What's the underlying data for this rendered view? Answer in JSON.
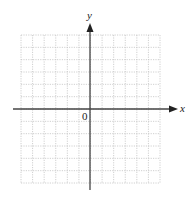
{
  "diagram": {
    "type": "coordinate-grid",
    "x_axis_label": "x",
    "y_axis_label": "y",
    "origin_label": "0",
    "grid": {
      "columns": 12,
      "rows": 12,
      "left_of_origin": 6,
      "right_of_origin": 6,
      "above_origin": 6,
      "below_origin": 6
    },
    "colors": {
      "grid": "#bbbbbb",
      "axis": "#333333",
      "text": "#222222"
    }
  }
}
